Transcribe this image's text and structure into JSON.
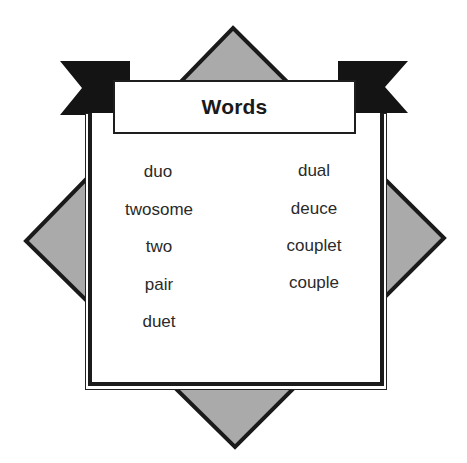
{
  "title": "Words",
  "colors": {
    "diamond_fill": "#aaaaaa",
    "diamond_stroke": "#1a1a1a",
    "flag_fill": "#141414",
    "panel_border": "#1c1c1c",
    "text": "#2a2a2a",
    "background": "#ffffff"
  },
  "words": {
    "left_column": [
      "duo",
      "twosome",
      "two",
      "pair",
      "duet"
    ],
    "right_column": [
      "dual",
      "deuce",
      "couplet",
      "couple"
    ]
  }
}
